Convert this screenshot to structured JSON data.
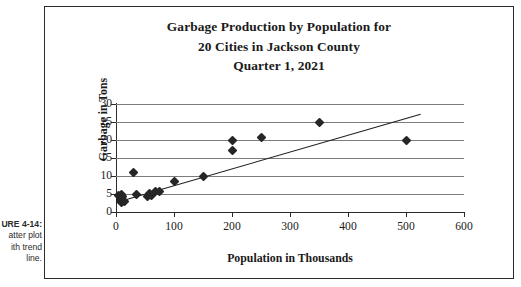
{
  "caption": {
    "label": "URE 4-14:",
    "line2": "atter plot",
    "line3": "ith trend",
    "line4": "line."
  },
  "chart_data": {
    "type": "scatter",
    "title": "Garbage Production by Population for 20 Cities in Jackson County Quarter 1, 2021",
    "title_lines": [
      "Garbage Production by Population for",
      "20 Cities in Jackson County",
      "Quarter 1, 2021"
    ],
    "xlabel": "Population in Thousands",
    "ylabel": "Garbage in Tons",
    "xlim": [
      0,
      600
    ],
    "ylim": [
      0,
      30
    ],
    "xticks": [
      0,
      100,
      200,
      300,
      400,
      500,
      600
    ],
    "yticks": [
      0,
      5,
      10,
      15,
      20,
      25,
      30
    ],
    "xtick_labels": [
      "0",
      "100",
      "200",
      "300",
      "400",
      "500",
      "600"
    ],
    "ytick_labels": [
      "0",
      "5",
      "10",
      "15",
      "20",
      "25",
      "30"
    ],
    "grid": "horizontal",
    "legend": "none",
    "series": [
      {
        "name": "Cities",
        "marker": "diamond",
        "color": "#262626",
        "points": [
          {
            "x": 5,
            "y": 4.6
          },
          {
            "x": 7,
            "y": 4.0
          },
          {
            "x": 8,
            "y": 3.3
          },
          {
            "x": 9,
            "y": 2.6
          },
          {
            "x": 10,
            "y": 5.0
          },
          {
            "x": 12,
            "y": 4.2
          },
          {
            "x": 14,
            "y": 3.0
          },
          {
            "x": 30,
            "y": 11.0
          },
          {
            "x": 35,
            "y": 5.0
          },
          {
            "x": 55,
            "y": 4.4
          },
          {
            "x": 58,
            "y": 5.2
          },
          {
            "x": 62,
            "y": 4.6
          },
          {
            "x": 68,
            "y": 5.6
          },
          {
            "x": 75,
            "y": 5.8
          },
          {
            "x": 100,
            "y": 8.4
          },
          {
            "x": 150,
            "y": 9.8
          },
          {
            "x": 200,
            "y": 19.8
          },
          {
            "x": 200,
            "y": 17.0
          },
          {
            "x": 250,
            "y": 20.8
          },
          {
            "x": 350,
            "y": 24.8
          },
          {
            "x": 500,
            "y": 19.8
          }
        ]
      }
    ],
    "trendline": {
      "name": "trend line",
      "color": "#1c1c1c",
      "x_start": 0,
      "y_start": 2.9,
      "x_end": 525,
      "y_end": 27.4
    }
  }
}
